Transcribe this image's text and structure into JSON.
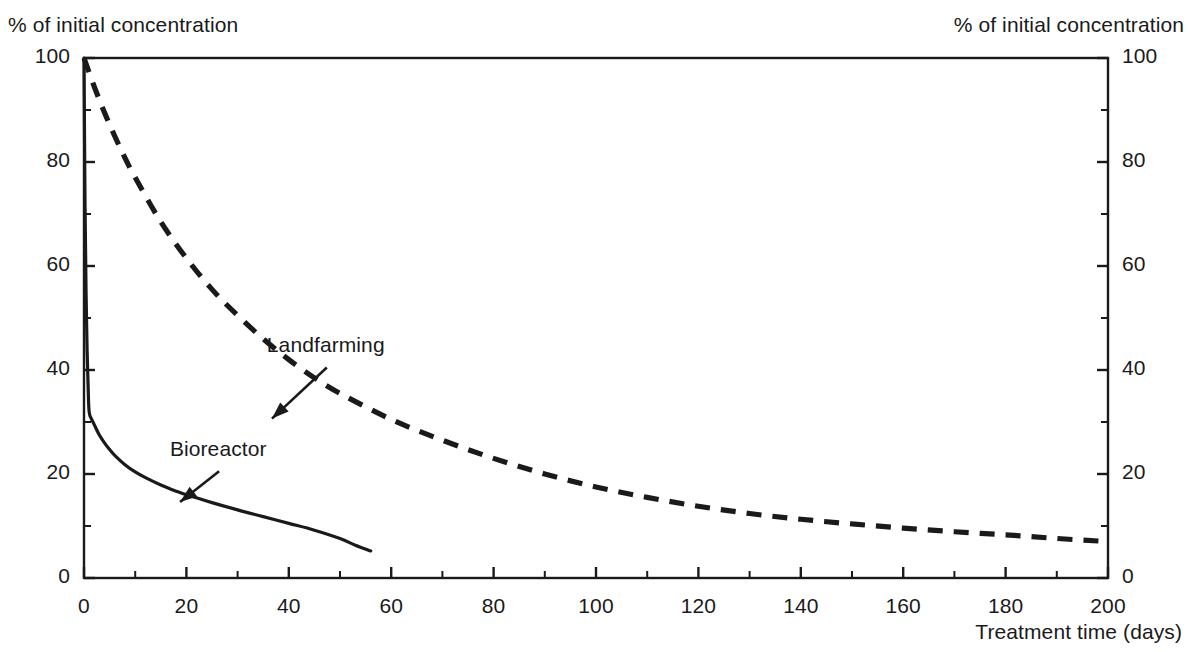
{
  "labels": {
    "y_axis_left": "% of initial concentration",
    "y_axis_right": "% of initial concentration",
    "x_axis": "Treatment time (days)"
  },
  "annotations": {
    "landfarming": "Landfarming",
    "bioreactor": "Bioreactor"
  },
  "colors": {
    "ink": "#1a1a1a",
    "background": "#ffffff"
  },
  "chart_data": {
    "type": "line",
    "title": "",
    "xlabel": "Treatment time (days)",
    "ylabel": "% of initial concentration",
    "xlim": [
      0,
      200
    ],
    "ylim": [
      0,
      100
    ],
    "xticks": [
      0,
      20,
      40,
      60,
      80,
      100,
      120,
      140,
      160,
      180,
      200
    ],
    "xtick_labels": [
      "0",
      "20",
      "40",
      "60",
      "80",
      "100",
      "120",
      "140",
      "160",
      "180",
      "200"
    ],
    "xminorticks": [
      10,
      30,
      50,
      70,
      90,
      110,
      130,
      150,
      170,
      190
    ],
    "yticks": [
      0,
      20,
      40,
      60,
      80,
      100
    ],
    "ytick_labels": [
      "0",
      "20",
      "40",
      "60",
      "80",
      "100"
    ],
    "yminorticks": [
      10,
      30,
      50,
      70,
      90
    ],
    "grid": false,
    "legend": "inline-annotations",
    "right_axis_mirrored": true,
    "series": [
      {
        "name": "Bioreactor",
        "style": "solid",
        "x": [
          0,
          0.2,
          0.4,
          0.6,
          0.8,
          1,
          1.5,
          2,
          3,
          4,
          5,
          6,
          8,
          10,
          12,
          15,
          18,
          20,
          25,
          30,
          35,
          40,
          45,
          50,
          53,
          56
        ],
        "y": [
          100,
          72,
          55,
          44,
          37,
          32,
          30.5,
          29.5,
          27.5,
          26,
          24.7,
          23.6,
          21.8,
          20.4,
          19.3,
          17.9,
          16.7,
          16.0,
          14.5,
          13.1,
          11.8,
          10.5,
          9.2,
          7.6,
          6.3,
          5.2
        ]
      },
      {
        "name": "Landfarming",
        "style": "dashed",
        "x": [
          0,
          2,
          4,
          6,
          8,
          10,
          15,
          20,
          25,
          30,
          35,
          40,
          45,
          50,
          60,
          70,
          80,
          90,
          100,
          110,
          120,
          130,
          140,
          150,
          160,
          170,
          180,
          190,
          200
        ],
        "y": [
          100,
          94.5,
          89.5,
          85,
          80.8,
          77,
          68.5,
          61.5,
          55.5,
          50.5,
          46,
          42,
          38.5,
          35.5,
          30.5,
          26.5,
          23,
          20,
          17.5,
          15.5,
          13.8,
          12.4,
          11.3,
          10.4,
          9.6,
          8.9,
          8.3,
          7.6,
          7
        ]
      }
    ],
    "annotations": [
      {
        "text": "Landfarming",
        "at_x": 36,
        "at_y": 30,
        "label_x": 48,
        "label_y": 41
      },
      {
        "text": "Bioreactor",
        "at_x": 18,
        "at_y": 14,
        "label_x": 27,
        "label_y": 21
      }
    ]
  }
}
